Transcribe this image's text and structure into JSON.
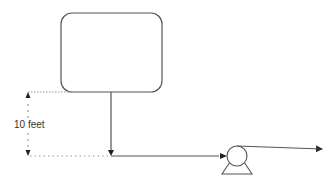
{
  "diagram": {
    "type": "process-flow",
    "elements": {
      "tank": {
        "shape": "rounded-rectangle",
        "label": ""
      },
      "dimension": {
        "label": "10 feet",
        "style": "dashed-with-arrows"
      },
      "pump": {
        "shape": "centrifugal-pump-symbol"
      },
      "pipes": [
        {
          "from": "tank-bottom",
          "to": "junction",
          "direction": "down"
        },
        {
          "from": "junction",
          "to": "pump-inlet",
          "direction": "right"
        },
        {
          "from": "pump-outlet",
          "to": "discharge",
          "direction": "right"
        }
      ]
    },
    "colors": {
      "stroke": "#555555",
      "dashed": "#888888",
      "background": "#ffffff"
    }
  }
}
